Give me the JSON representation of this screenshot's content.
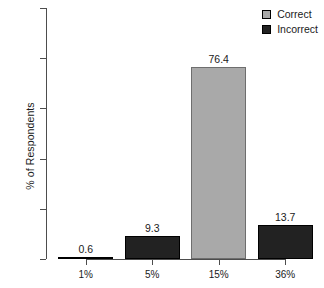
{
  "chart_data": {
    "type": "bar",
    "title": "",
    "xlabel": "",
    "ylabel": "% of Respondents",
    "categories": [
      "1%",
      "5%",
      "15%",
      "36%"
    ],
    "values": [
      0.6,
      9.3,
      76.4,
      13.7
    ],
    "value_labels": [
      "0.6",
      "9.3",
      "76.4",
      "13.7"
    ],
    "bar_groups": [
      "Incorrect",
      "Incorrect",
      "Correct",
      "Incorrect"
    ],
    "ylim": [
      0,
      100
    ],
    "yticks": [
      0,
      20,
      40,
      60,
      80,
      100
    ],
    "ytick_labels": [
      "0",
      "20",
      "40",
      "60",
      "80",
      "100"
    ],
    "grid": false,
    "legend_position": "top-right",
    "legend": [
      {
        "name": "Correct",
        "color": "#a9a9a9"
      },
      {
        "name": "Incorrect",
        "color": "#222222"
      }
    ]
  },
  "colors": {
    "correct": "#a9a9a9",
    "incorrect": "#222222",
    "axis": "#4d4d4d",
    "text": "#1a1a1a",
    "background": "#ffffff"
  }
}
